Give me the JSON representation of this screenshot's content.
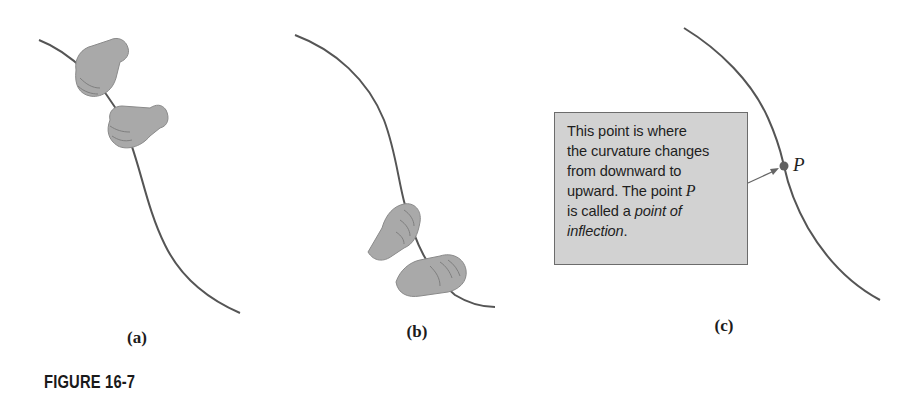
{
  "figure": {
    "caption": "FIGURE 16-7",
    "panels": [
      {
        "id": "a",
        "label": "(a)",
        "description": "Two hands gripping a curve that bends downward (concave down at top)",
        "curve_points": [
          [
            39,
            40
          ],
          [
            80,
            62
          ],
          [
            118,
            110
          ],
          [
            136,
            150
          ],
          [
            150,
            200
          ],
          [
            170,
            250
          ],
          [
            200,
            290
          ],
          [
            240,
            313
          ]
        ]
      },
      {
        "id": "b",
        "label": "(b)",
        "description": "Two hands gripping a curve in its lower section (concave up)",
        "curve_points": [
          [
            295,
            35
          ],
          [
            350,
            65
          ],
          [
            380,
            110
          ],
          [
            397,
            160
          ],
          [
            403,
            190
          ],
          [
            420,
            250
          ],
          [
            460,
            300
          ],
          [
            495,
            307
          ]
        ]
      },
      {
        "id": "c",
        "label": "(c)",
        "description": "Curve with inflection point P and explanatory callout",
        "curve_points": [
          [
            684,
            28
          ],
          [
            740,
            70
          ],
          [
            770,
            120
          ],
          [
            784,
            166
          ],
          [
            800,
            215
          ],
          [
            830,
            260
          ],
          [
            880,
            300
          ]
        ],
        "point": {
          "name": "P",
          "x": 784,
          "y": 166
        },
        "callout": {
          "line1": "This point is where",
          "line2": "the curvature changes",
          "line3": "from downward to",
          "line4_prefix": "upward. The point ",
          "line4_var": "P",
          "line5_prefix": "is called a ",
          "line5_em": "point of",
          "line6_em": "inflection",
          "line6_suffix": "."
        }
      }
    ],
    "colors": {
      "curve": "#555555",
      "hand_fill": "#a9a9a9",
      "hand_shade": "#8a8a8a",
      "callout_bg": "#d2d2d2",
      "callout_border": "#6c6c6c",
      "point": "#606060"
    }
  }
}
